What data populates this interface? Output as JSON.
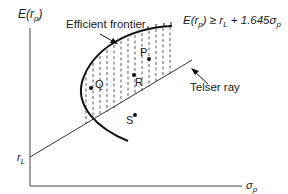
{
  "diagram": {
    "y_axis_label": "E(r",
    "y_axis_sub": "p",
    "x_axis_label": "σ",
    "x_axis_sub": "p",
    "intercept_label": "r",
    "intercept_sub": "L",
    "frontier_label": "Efficient frontier",
    "constraint_text": {
      "lhs": "E(r",
      "lhs_sub": "p",
      "op": ") ≥ r",
      "rL_sub": "L",
      "rhs": " + 1.645σ",
      "rhs_sub": "p"
    },
    "ray_label": "Telser ray",
    "points": [
      {
        "name": "P",
        "label": "P"
      },
      {
        "name": "Q",
        "label": "Q"
      },
      {
        "name": "R",
        "label": "R"
      },
      {
        "name": "S",
        "label": "S"
      }
    ],
    "colors": {
      "line": "#1a1a1a",
      "hatch": "#333333"
    }
  }
}
